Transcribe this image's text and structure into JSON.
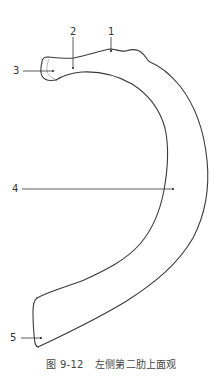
{
  "figure": {
    "number": "图 9-12",
    "title": "左侧第二肋上面观",
    "colors": {
      "outline": "#3a3a3a",
      "leader": "#333333",
      "label": "#333333",
      "caption": "#444444"
    }
  },
  "labels": [
    {
      "id": "1",
      "text": "1",
      "x": 108,
      "y": 27,
      "target": [
        111,
        51
      ]
    },
    {
      "id": "2",
      "text": "2",
      "x": 70,
      "y": 27,
      "target": [
        73,
        68
      ]
    },
    {
      "id": "3",
      "text": "3",
      "x": 13,
      "y": 66,
      "target": [
        53,
        71
      ]
    },
    {
      "id": "4",
      "text": "4",
      "x": 12,
      "y": 184,
      "target": [
        173,
        189
      ]
    },
    {
      "id": "5",
      "text": "5",
      "x": 10,
      "y": 333,
      "target": [
        41,
        338
      ]
    }
  ]
}
